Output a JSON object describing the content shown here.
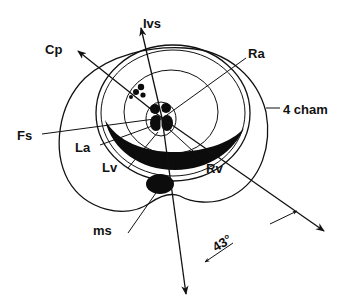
{
  "figure": {
    "type": "cross-sectional anatomical scan-plane diagram (fetal thorax)",
    "labels": {
      "ivs": "Ivs",
      "cp": "Cp",
      "ra": "Ra",
      "fs": "Fs",
      "four_cham": "4 cham",
      "la": "La",
      "lv": "Lv",
      "rv": "Rv",
      "ms": "ms",
      "angle": "43°"
    },
    "structures": [
      "outer body contour",
      "concentric rings",
      "black crescent",
      "central heart cross-section",
      "small black cluster (Cp)",
      "black oval (ms)"
    ],
    "scan_lines": [
      {
        "name": "Ivs",
        "direction": "up / down axis"
      },
      {
        "name": "Cp",
        "direction": "upper-left"
      },
      {
        "name": "Ra",
        "direction": "upper-right"
      },
      {
        "name": "Fs",
        "direction": "left"
      },
      {
        "name": "4 cham",
        "direction": "lower-right"
      }
    ],
    "angle_measurement": "43°",
    "colors": {
      "ink": "#111111",
      "background": "#ffffff"
    }
  }
}
